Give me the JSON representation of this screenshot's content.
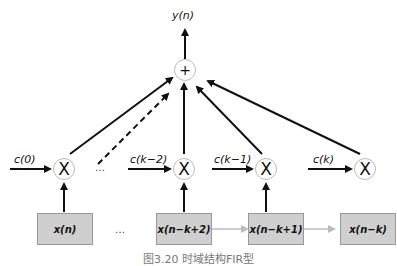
{
  "diagram": {
    "output_label": "y(n)",
    "adder_symbol": "+",
    "multiplier_symbol": "X",
    "coefficients": [
      "c(0)",
      "c(k−2)",
      "c(k−1)",
      "c(k)"
    ],
    "registers": [
      "x(n)",
      "x(n−k+2)",
      "x(n−k+1)",
      "x(n−k)"
    ],
    "ellipsis": "…",
    "caption": "图3.20  时域结构FIR型"
  }
}
